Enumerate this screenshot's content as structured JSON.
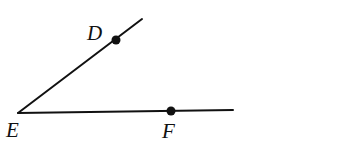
{
  "diagram": {
    "type": "angle",
    "colors": {
      "stroke": "#111111",
      "background": "#ffffff"
    },
    "vertex": {
      "label": "E",
      "x": 18,
      "y": 113
    },
    "points": [
      {
        "label": "D",
        "x": 116,
        "y": 40
      },
      {
        "label": "F",
        "x": 171,
        "y": 111
      }
    ],
    "rays": [
      {
        "name": "ray-ED",
        "from": "E",
        "through": "D",
        "end": {
          "x": 142,
          "y": 19
        }
      },
      {
        "name": "ray-EF",
        "from": "E",
        "through": "F",
        "end": {
          "x": 233,
          "y": 110
        }
      }
    ],
    "labels": {
      "D": "D",
      "E": "E",
      "F": "F"
    }
  }
}
